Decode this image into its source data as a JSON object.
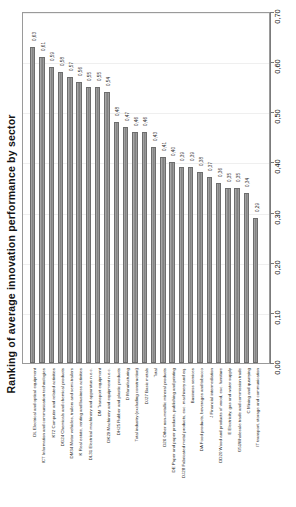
{
  "chart_data": {
    "type": "bar",
    "title": "Ranking of average innovation performance by sector",
    "xlabel": "",
    "ylabel": "",
    "ylim": [
      0.0,
      0.7
    ],
    "grid": false,
    "legend": null,
    "axis_position": "right",
    "orientation": "vertical",
    "tick_labels": [
      "0,00",
      "0,10",
      "0,20",
      "0,30",
      "0,40",
      "0,50",
      "0,60",
      "0,70"
    ],
    "tick_values": [
      0.0,
      0.1,
      0.2,
      0.3,
      0.4,
      0.5,
      0.6,
      0.7
    ],
    "bar_color": "#8e8e8e",
    "categories": [
      "DL Electrical and optical equipment",
      "ICT Information and communication technologies",
      "K72 Computer and related activities",
      "DG24 Chemicals and chemical products",
      "DM34 Motor vehicles, trailers and semi-trailers",
      "K Real estate, renting and business activities",
      "DL31 Electrical machinery and apparatus n.e.c.",
      "DM Transport equipment",
      "DK29 Machinery and equipment n.e.c.",
      "DH25 Rubber and plastic products",
      "D Manufacturing",
      "Total industry (excluding construction)",
      "DJ27 Basic metals",
      "Total",
      "D26 Other non-metallic mineral products",
      "DE Paper and paper products, publishing and printing",
      "DJ28 Fabricated metal products, exc. machinery and eq.",
      "Business services",
      "DA Food products, beverages and tobacco",
      "J Financial intermediation",
      "DD20 Wood and products of wood, exc. furniture",
      "E Electricity, gas and water supply",
      "G51Wholesale trade and commission trade",
      "C Mining and quarrying",
      "IT transport, storage and communication"
    ],
    "values": [
      0.63,
      0.61,
      0.59,
      0.58,
      0.57,
      0.56,
      0.55,
      0.55,
      0.54,
      0.48,
      0.47,
      0.46,
      0.46,
      0.43,
      0.41,
      0.4,
      0.39,
      0.39,
      0.38,
      0.37,
      0.36,
      0.35,
      0.35,
      0.34,
      0.29
    ],
    "value_labels": [
      "0,63",
      "0,61",
      "0,59",
      "0,58",
      "0,57",
      "0,56",
      "0,55",
      "0,55",
      "0,54",
      "0,48",
      "0,47",
      "0,46",
      "0,46",
      "0,43",
      "0,41",
      "0,40",
      "0,39",
      "0,39",
      "0,38",
      "0,37",
      "0,36",
      "0,35",
      "0,35",
      "0,34",
      "0,29"
    ]
  }
}
